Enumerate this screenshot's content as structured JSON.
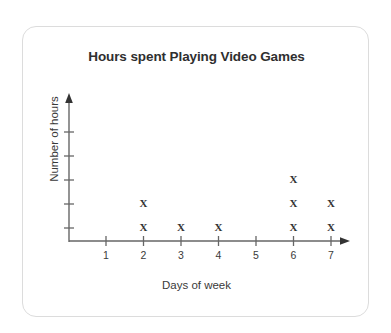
{
  "card": {
    "background": "#ffffff",
    "border_color": "#dcdcdc"
  },
  "chart_data": {
    "type": "scatter",
    "plot_style": "dot-plot",
    "title": "Hours spent Playing Video Games",
    "xlabel": "Days of week",
    "ylabel": "Number of hours",
    "categories": [
      "1",
      "2",
      "3",
      "4",
      "5",
      "6",
      "7"
    ],
    "x": [
      1,
      2,
      3,
      4,
      5,
      6,
      7
    ],
    "values": [
      0,
      2,
      1,
      1,
      0,
      3,
      2
    ],
    "marker": "X",
    "marker_color": "#333333",
    "xtick_labels": [
      "1",
      "2",
      "3",
      "4",
      "5",
      "6",
      "7"
    ],
    "ytick_labels": [
      "",
      "",
      "",
      "",
      ""
    ],
    "ytick_count": 5,
    "xlim": [
      0.5,
      7.5
    ],
    "ylim": [
      0,
      5
    ],
    "grid": false,
    "legend": null,
    "axis_color": "#555555",
    "axis_arrows": true,
    "points": [
      {
        "day": 2,
        "level": 1
      },
      {
        "day": 2,
        "level": 2
      },
      {
        "day": 3,
        "level": 1
      },
      {
        "day": 4,
        "level": 1
      },
      {
        "day": 6,
        "level": 1
      },
      {
        "day": 6,
        "level": 2
      },
      {
        "day": 6,
        "level": 3
      },
      {
        "day": 7,
        "level": 1
      },
      {
        "day": 7,
        "level": 2
      }
    ]
  }
}
